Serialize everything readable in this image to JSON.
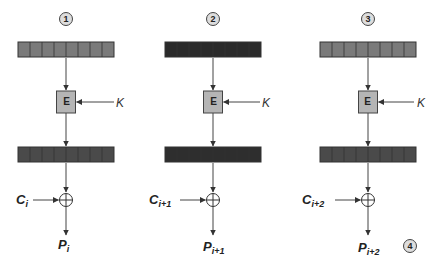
{
  "diagram": {
    "key_label": "K",
    "encrypt_label": "E",
    "xor_symbol": "⊕",
    "stages": [
      {
        "step": "1",
        "top_register_color": "#7a7a7a",
        "bottom_register_color": "#4a4a4a",
        "cipher_base": "C",
        "cipher_sub": "i",
        "plain_base": "P",
        "plain_sub": "i"
      },
      {
        "step": "2",
        "top_register_color": "#2a2a2a",
        "bottom_register_color": "#2e2e2e",
        "cipher_base": "C",
        "cipher_sub": "i+1",
        "plain_base": "P",
        "plain_sub": "i+1"
      },
      {
        "step": "3",
        "top_register_color": "#7a7a7a",
        "bottom_register_color": "#4a4a4a",
        "cipher_base": "C",
        "cipher_sub": "i+2",
        "plain_base": "P",
        "plain_sub": "i+2"
      }
    ],
    "final_step": "4",
    "register_cells": 8
  }
}
